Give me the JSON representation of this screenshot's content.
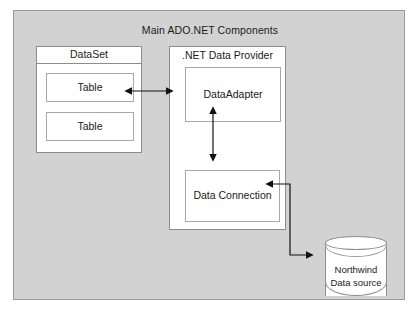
{
  "diagram": {
    "title": "Main ADO.NET Components",
    "background_color": "#d2d2d2",
    "box_fill": "#ffffff",
    "line_color": "#8d8d8d",
    "text_color": "#1b1b1b"
  },
  "dataset": {
    "title": "DataSet",
    "tables": [
      {
        "label": "Table"
      },
      {
        "label": "Table"
      }
    ]
  },
  "provider": {
    "title": ".NET Data Provider",
    "data_adapter": "DataAdapter",
    "data_connection": "Data Connection"
  },
  "data_source": {
    "line1": "Northwind",
    "line2": "Data source"
  },
  "connectors": [
    {
      "name": "dataset-to-dataadapter",
      "from": "DataSet",
      "to": "DataAdapter",
      "direction": "bidirectional",
      "orientation": "horizontal"
    },
    {
      "name": "dataadapter-to-dataconnection",
      "from": "DataAdapter",
      "to": "Data Connection",
      "direction": "bidirectional",
      "orientation": "vertical"
    },
    {
      "name": "dataconnection-to-datasource",
      "from": "Data Connection",
      "to": "Northwind Data source",
      "direction": "bidirectional",
      "orientation": "elbow"
    }
  ]
}
